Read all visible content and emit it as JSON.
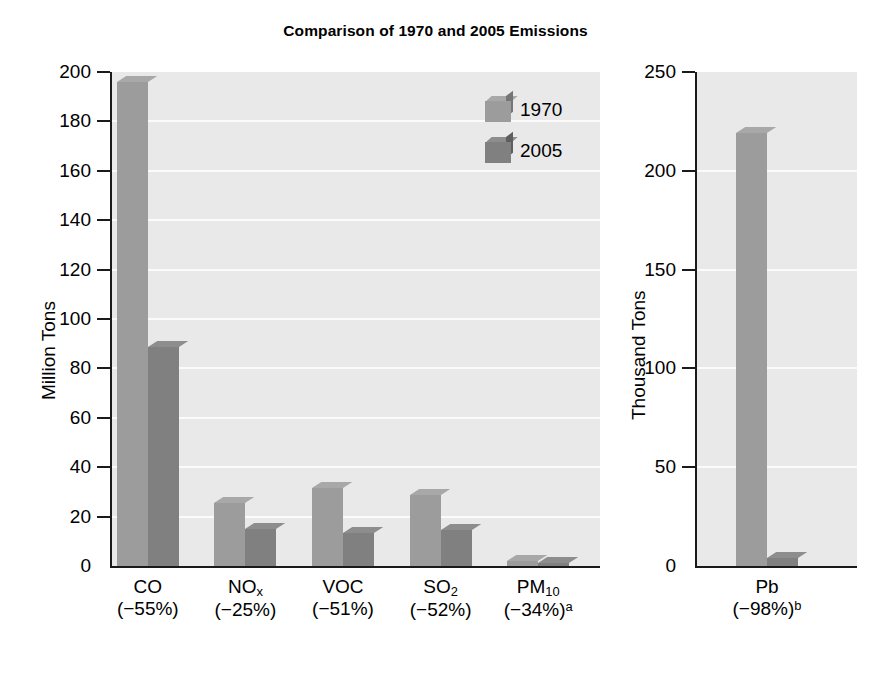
{
  "chart_data": {
    "type": "bar",
    "title": "Comparison of 1970 and 2005 Emissions",
    "legend": {
      "position": "top-right",
      "entries": [
        "1970",
        "2005"
      ]
    },
    "grid": true,
    "panels": [
      {
        "id": "criteria-pollutants",
        "ylabel": "Million Tons",
        "ylim": [
          0,
          200
        ],
        "yticks": [
          0,
          20,
          40,
          60,
          80,
          100,
          120,
          140,
          160,
          180,
          200
        ],
        "ytick_labels": [
          "0",
          "20",
          "40",
          "60",
          "80",
          "100",
          "120",
          "140",
          "160",
          "180",
          "200"
        ],
        "categories": [
          {
            "name": "CO",
            "sub": "",
            "change": "(−55%)",
            "note": ""
          },
          {
            "name": "NO",
            "sub": "x",
            "change": "(−25%)",
            "note": ""
          },
          {
            "name": "VOC",
            "sub": "",
            "change": "(−51%)",
            "note": ""
          },
          {
            "name": "SO",
            "sub": "2",
            "change": "(−52%)",
            "note": ""
          },
          {
            "name": "PM",
            "sub": "10",
            "change": "(−34%)",
            "note": "a"
          }
        ],
        "series": [
          {
            "name": "1970",
            "color": "#9c9c9c",
            "values": [
              196,
              25.4,
              31.6,
              28.6,
              2.1
            ]
          },
          {
            "name": "2005",
            "color": "#808080",
            "values": [
              88.5,
              15.1,
              13.5,
              14.4,
              1.1
            ]
          }
        ]
      },
      {
        "id": "lead",
        "ylabel": "Thousand Tons",
        "ylim": [
          0,
          250
        ],
        "yticks": [
          0,
          50,
          100,
          150,
          200,
          250
        ],
        "ytick_labels": [
          "0",
          "50",
          "100",
          "150",
          "200",
          "250"
        ],
        "categories": [
          {
            "name": "Pb",
            "sub": "",
            "change": "(−98%)",
            "note": "b"
          }
        ],
        "series": [
          {
            "name": "1970",
            "color": "#9c9c9c",
            "values": [
              219
            ]
          },
          {
            "name": "2005",
            "color": "#808080",
            "values": [
              4
            ]
          }
        ]
      }
    ]
  },
  "title": "Comparison of 1970 and 2005 Emissions",
  "legend": {
    "items": [
      {
        "label": "1970"
      },
      {
        "label": "2005"
      }
    ]
  },
  "left_panel": {
    "axis_title": "Million Tons",
    "ticks": [
      "200",
      "180",
      "160",
      "140",
      "120",
      "100",
      "80",
      "60",
      "40",
      "20",
      "0"
    ],
    "categories": [
      {
        "line1_main": "CO",
        "line1_sub": "",
        "line2": "(−55%)",
        "line2_sup": ""
      },
      {
        "line1_main": "NO",
        "line1_sub": "x",
        "line2": "(−25%)",
        "line2_sup": ""
      },
      {
        "line1_main": "VOC",
        "line1_sub": "",
        "line2": "(−51%)",
        "line2_sup": ""
      },
      {
        "line1_main": "SO",
        "line1_sub": "2",
        "line2": "(−52%)",
        "line2_sup": ""
      },
      {
        "line1_main": "PM",
        "line1_sub": "10",
        "line2": "(−34%)",
        "line2_sup": "a"
      }
    ]
  },
  "right_panel": {
    "axis_title": "Thousand Tons",
    "ticks": [
      "250",
      "200",
      "150",
      "100",
      "50",
      "0"
    ],
    "categories": [
      {
        "line1_main": "Pb",
        "line1_sub": "",
        "line2": "(−98%)",
        "line2_sup": "b"
      }
    ]
  },
  "colors": {
    "series_1970": "#9c9c9c",
    "series_2005": "#808080",
    "plot_background": "#e9e9e9",
    "gridline": "#fbfbfb",
    "axis": "#1a1a1a"
  }
}
